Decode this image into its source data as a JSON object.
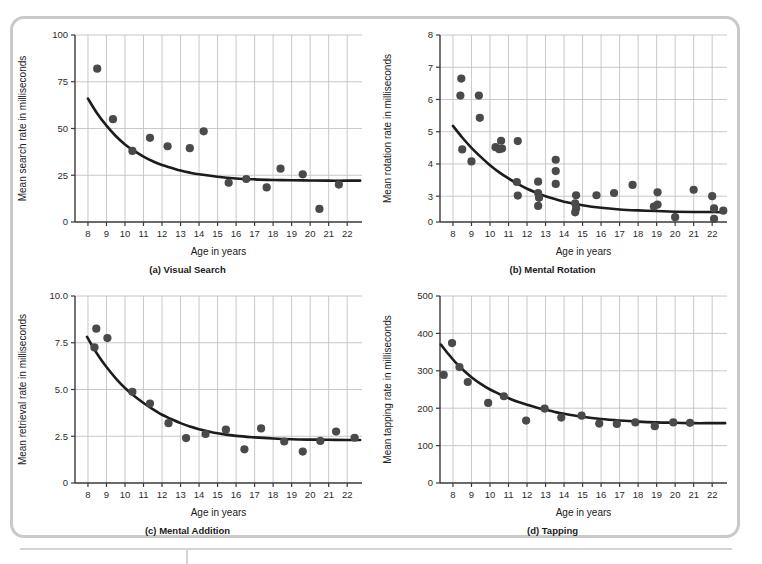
{
  "figure": {
    "panel_count": 4,
    "shared_xlabel": "Age in years"
  },
  "chart_data": [
    {
      "type": "scatter",
      "panel": "a",
      "caption": "(a) Visual Search",
      "title": "",
      "xlabel": "Age in years",
      "ylabel": "Mean search rate in milliseconds",
      "xlim": [
        7.3,
        22.8
      ],
      "ylim": [
        0,
        100
      ],
      "xticks": [
        8,
        9,
        10,
        11,
        12,
        13,
        14,
        15,
        16,
        17,
        18,
        19,
        20,
        21,
        22
      ],
      "yticks": [
        0,
        25,
        50,
        75,
        100
      ],
      "grid": true,
      "legend": "none",
      "points": [
        {
          "x": 8.5,
          "y": 82
        },
        {
          "x": 9.35,
          "y": 55
        },
        {
          "x": 10.4,
          "y": 38
        },
        {
          "x": 11.35,
          "y": 45
        },
        {
          "x": 12.3,
          "y": 40.5
        },
        {
          "x": 13.5,
          "y": 39.5
        },
        {
          "x": 14.25,
          "y": 48.5
        },
        {
          "x": 15.6,
          "y": 21
        },
        {
          "x": 16.55,
          "y": 23
        },
        {
          "x": 17.65,
          "y": 18.5
        },
        {
          "x": 18.4,
          "y": 28.5
        },
        {
          "x": 19.6,
          "y": 25.5
        },
        {
          "x": 20.5,
          "y": 7
        },
        {
          "x": 21.55,
          "y": 20
        }
      ],
      "fit_curve": {
        "form": "exponential-decay",
        "asymptote": 22,
        "points": [
          {
            "x": 8.0,
            "y": 66
          },
          {
            "x": 8.5,
            "y": 58
          },
          {
            "x": 9.0,
            "y": 51.5
          },
          {
            "x": 9.5,
            "y": 46
          },
          {
            "x": 10.0,
            "y": 41.5
          },
          {
            "x": 10.5,
            "y": 38
          },
          {
            "x": 11.0,
            "y": 35
          },
          {
            "x": 11.5,
            "y": 32.5
          },
          {
            "x": 12.0,
            "y": 30.5
          },
          {
            "x": 12.5,
            "y": 29
          },
          {
            "x": 13.0,
            "y": 27.5
          },
          {
            "x": 13.5,
            "y": 26.4
          },
          {
            "x": 14.0,
            "y": 25.5
          },
          {
            "x": 15.0,
            "y": 24.2
          },
          {
            "x": 16.0,
            "y": 23.3
          },
          {
            "x": 17.0,
            "y": 22.8
          },
          {
            "x": 18.0,
            "y": 22.5
          },
          {
            "x": 19.0,
            "y": 22.3
          },
          {
            "x": 20.0,
            "y": 22.2
          },
          {
            "x": 21.0,
            "y": 22.1
          },
          {
            "x": 22.0,
            "y": 22.1
          },
          {
            "x": 22.7,
            "y": 22.1
          }
        ]
      }
    },
    {
      "type": "scatter",
      "panel": "b",
      "caption": "(b) Mental Rotation",
      "title": "",
      "xlabel": "Age in years",
      "ylabel": "Mean rotation rate in milliseconds",
      "xlim": [
        7.3,
        22.8
      ],
      "ylim": [
        2.2,
        8
      ],
      "xticks": [
        8,
        9,
        10,
        11,
        12,
        13,
        14,
        15,
        16,
        17,
        18,
        19,
        20,
        21,
        22
      ],
      "yticks": [
        0,
        3,
        4,
        5,
        6,
        7,
        8
      ],
      "ytick_labels": [
        "0",
        "3",
        "4",
        "5",
        "6",
        "7",
        "8"
      ],
      "grid": true,
      "legend": "none",
      "points": [
        {
          "x": 8.45,
          "y": 6.65
        },
        {
          "x": 8.4,
          "y": 6.12
        },
        {
          "x": 9.4,
          "y": 6.12
        },
        {
          "x": 9.45,
          "y": 5.43
        },
        {
          "x": 8.5,
          "y": 4.45
        },
        {
          "x": 9.0,
          "y": 4.08
        },
        {
          "x": 10.3,
          "y": 4.52
        },
        {
          "x": 10.5,
          "y": 4.46
        },
        {
          "x": 10.6,
          "y": 4.72
        },
        {
          "x": 10.65,
          "y": 4.48
        },
        {
          "x": 11.5,
          "y": 4.71
        },
        {
          "x": 11.45,
          "y": 3.44
        },
        {
          "x": 11.5,
          "y": 3.02
        },
        {
          "x": 12.6,
          "y": 3.45
        },
        {
          "x": 12.6,
          "y": 3.1
        },
        {
          "x": 12.65,
          "y": 2.95
        },
        {
          "x": 12.6,
          "y": 2.7
        },
        {
          "x": 13.55,
          "y": 4.13
        },
        {
          "x": 13.55,
          "y": 3.78
        },
        {
          "x": 13.55,
          "y": 3.38
        },
        {
          "x": 14.65,
          "y": 3.03
        },
        {
          "x": 14.6,
          "y": 2.78
        },
        {
          "x": 14.65,
          "y": 2.62
        },
        {
          "x": 14.6,
          "y": 2.5
        },
        {
          "x": 15.75,
          "y": 3.03
        },
        {
          "x": 16.7,
          "y": 3.1
        },
        {
          "x": 17.7,
          "y": 3.35
        },
        {
          "x": 18.85,
          "y": 2.68
        },
        {
          "x": 19.05,
          "y": 3.12
        },
        {
          "x": 19.05,
          "y": 2.74
        },
        {
          "x": 20.0,
          "y": 2.35
        },
        {
          "x": 21.0,
          "y": 3.2
        },
        {
          "x": 22.0,
          "y": 3.0
        },
        {
          "x": 22.1,
          "y": 2.62
        },
        {
          "x": 22.1,
          "y": 2.3
        },
        {
          "x": 22.6,
          "y": 2.55
        }
      ],
      "fit_curve": {
        "form": "exponential-decay",
        "asymptote": 2.5,
        "points": [
          {
            "x": 8.0,
            "y": 5.18
          },
          {
            "x": 8.5,
            "y": 4.82
          },
          {
            "x": 9.0,
            "y": 4.5
          },
          {
            "x": 9.5,
            "y": 4.22
          },
          {
            "x": 10.0,
            "y": 3.96
          },
          {
            "x": 10.5,
            "y": 3.74
          },
          {
            "x": 11.0,
            "y": 3.55
          },
          {
            "x": 11.5,
            "y": 3.38
          },
          {
            "x": 12.0,
            "y": 3.23
          },
          {
            "x": 12.5,
            "y": 3.11
          },
          {
            "x": 13.0,
            "y": 3.0
          },
          {
            "x": 13.5,
            "y": 2.91
          },
          {
            "x": 14.0,
            "y": 2.83
          },
          {
            "x": 15.0,
            "y": 2.72
          },
          {
            "x": 16.0,
            "y": 2.64
          },
          {
            "x": 17.0,
            "y": 2.59
          },
          {
            "x": 18.0,
            "y": 2.56
          },
          {
            "x": 19.0,
            "y": 2.54
          },
          {
            "x": 20.0,
            "y": 2.52
          },
          {
            "x": 21.0,
            "y": 2.51
          },
          {
            "x": 22.0,
            "y": 2.51
          },
          {
            "x": 22.7,
            "y": 2.5
          }
        ]
      }
    },
    {
      "type": "scatter",
      "panel": "c",
      "caption": "(c) Mental Addition",
      "title": "",
      "xlabel": "Age in years",
      "ylabel": "Mean retrieval rate in milliseconds",
      "xlim": [
        7.3,
        22.8
      ],
      "ylim": [
        0,
        10
      ],
      "xticks": [
        8,
        9,
        10,
        11,
        12,
        13,
        14,
        15,
        16,
        17,
        18,
        19,
        20,
        21,
        22
      ],
      "yticks": [
        0,
        2.5,
        5.0,
        7.5,
        10.0
      ],
      "ytick_labels": [
        "0",
        "2.5",
        "5.0",
        "7.5",
        "10.0"
      ],
      "grid": true,
      "legend": "none",
      "points": [
        {
          "x": 8.45,
          "y": 8.25
        },
        {
          "x": 8.35,
          "y": 7.25
        },
        {
          "x": 9.05,
          "y": 7.75
        },
        {
          "x": 10.4,
          "y": 4.88
        },
        {
          "x": 11.35,
          "y": 4.25
        },
        {
          "x": 12.35,
          "y": 3.2
        },
        {
          "x": 13.3,
          "y": 2.4
        },
        {
          "x": 14.35,
          "y": 2.62
        },
        {
          "x": 15.45,
          "y": 2.85
        },
        {
          "x": 16.45,
          "y": 1.8
        },
        {
          "x": 17.35,
          "y": 2.92
        },
        {
          "x": 18.6,
          "y": 2.22
        },
        {
          "x": 19.6,
          "y": 1.68
        },
        {
          "x": 20.55,
          "y": 2.25
        },
        {
          "x": 21.4,
          "y": 2.75
        },
        {
          "x": 22.4,
          "y": 2.42
        }
      ],
      "fit_curve": {
        "form": "exponential-decay",
        "asymptote": 2.3,
        "points": [
          {
            "x": 7.95,
            "y": 7.82
          },
          {
            "x": 8.25,
            "y": 7.3
          },
          {
            "x": 8.6,
            "y": 6.75
          },
          {
            "x": 9.0,
            "y": 6.2
          },
          {
            "x": 9.5,
            "y": 5.6
          },
          {
            "x": 10.0,
            "y": 5.08
          },
          {
            "x": 10.5,
            "y": 4.65
          },
          {
            "x": 11.0,
            "y": 4.28
          },
          {
            "x": 11.5,
            "y": 3.95
          },
          {
            "x": 12.0,
            "y": 3.65
          },
          {
            "x": 12.5,
            "y": 3.42
          },
          {
            "x": 13.0,
            "y": 3.2
          },
          {
            "x": 13.5,
            "y": 3.02
          },
          {
            "x": 14.0,
            "y": 2.88
          },
          {
            "x": 15.0,
            "y": 2.66
          },
          {
            "x": 16.0,
            "y": 2.52
          },
          {
            "x": 17.0,
            "y": 2.44
          },
          {
            "x": 18.0,
            "y": 2.38
          },
          {
            "x": 19.0,
            "y": 2.34
          },
          {
            "x": 20.0,
            "y": 2.32
          },
          {
            "x": 21.0,
            "y": 2.31
          },
          {
            "x": 22.0,
            "y": 2.3
          },
          {
            "x": 22.7,
            "y": 2.3
          }
        ]
      }
    },
    {
      "type": "scatter",
      "panel": "d",
      "caption": "(d) Tapping",
      "title": "",
      "xlabel": "Age in years",
      "ylabel": "Mean tapping rate in milliseconds",
      "xlim": [
        7.3,
        22.8
      ],
      "ylim": [
        0,
        500
      ],
      "xticks": [
        8,
        9,
        10,
        11,
        12,
        13,
        14,
        15,
        16,
        17,
        18,
        19,
        20,
        21,
        22
      ],
      "yticks": [
        0,
        100,
        200,
        300,
        400,
        500
      ],
      "grid": true,
      "legend": "none",
      "points": [
        {
          "x": 7.5,
          "y": 289
        },
        {
          "x": 7.95,
          "y": 374
        },
        {
          "x": 8.35,
          "y": 310
        },
        {
          "x": 8.8,
          "y": 270
        },
        {
          "x": 9.9,
          "y": 214
        },
        {
          "x": 10.75,
          "y": 232
        },
        {
          "x": 11.95,
          "y": 167
        },
        {
          "x": 12.95,
          "y": 199
        },
        {
          "x": 13.85,
          "y": 175
        },
        {
          "x": 14.95,
          "y": 180
        },
        {
          "x": 15.9,
          "y": 159
        },
        {
          "x": 16.85,
          "y": 158
        },
        {
          "x": 17.85,
          "y": 162
        },
        {
          "x": 18.9,
          "y": 152
        },
        {
          "x": 19.9,
          "y": 162
        },
        {
          "x": 20.8,
          "y": 161
        }
      ],
      "fit_curve": {
        "form": "exponential-decay",
        "asymptote": 160,
        "points": [
          {
            "x": 7.35,
            "y": 370
          },
          {
            "x": 7.75,
            "y": 345
          },
          {
            "x": 8.15,
            "y": 322
          },
          {
            "x": 8.6,
            "y": 300
          },
          {
            "x": 9.0,
            "y": 283
          },
          {
            "x": 9.5,
            "y": 265
          },
          {
            "x": 10.0,
            "y": 250
          },
          {
            "x": 10.5,
            "y": 238
          },
          {
            "x": 11.0,
            "y": 227
          },
          {
            "x": 11.5,
            "y": 217
          },
          {
            "x": 12.0,
            "y": 209
          },
          {
            "x": 12.5,
            "y": 202
          },
          {
            "x": 13.0,
            "y": 196
          },
          {
            "x": 13.5,
            "y": 190
          },
          {
            "x": 14.0,
            "y": 185
          },
          {
            "x": 15.0,
            "y": 177
          },
          {
            "x": 16.0,
            "y": 171
          },
          {
            "x": 17.0,
            "y": 167
          },
          {
            "x": 18.0,
            "y": 164
          },
          {
            "x": 19.0,
            "y": 162
          },
          {
            "x": 20.0,
            "y": 161
          },
          {
            "x": 21.0,
            "y": 160
          },
          {
            "x": 22.0,
            "y": 160
          },
          {
            "x": 22.7,
            "y": 160
          }
        ]
      }
    }
  ]
}
